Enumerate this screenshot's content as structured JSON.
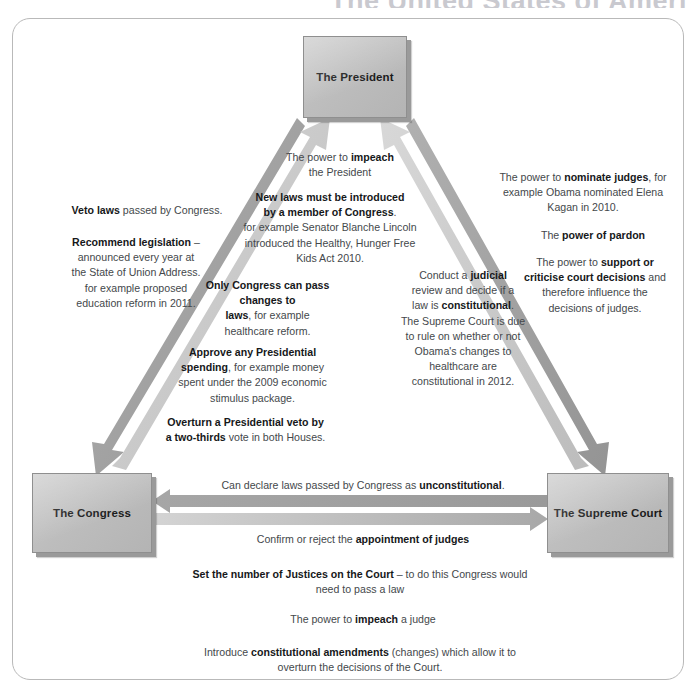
{
  "page": {
    "title_cropped": "The United States of Ameri"
  },
  "nodes": {
    "president": "The President",
    "congress": "The Congress",
    "supreme_court": "The Supreme Court"
  },
  "annotations": {
    "congress_to_president": [
      {
        "id": "impeach-president",
        "lines": [
          [
            {
              "t": "The power to ",
              "b": false
            },
            {
              "t": "impeach",
              "b": true
            }
          ],
          [
            {
              "t": "the President",
              "b": false
            }
          ]
        ]
      },
      {
        "id": "new-laws-introduced",
        "lines": [
          [
            {
              "t": "New laws must be introduced",
              "b": true
            }
          ],
          [
            {
              "t": "by a member of Congress",
              "b": true
            },
            {
              "t": ".",
              "b": false
            }
          ],
          [
            {
              "t": "for example Senator Blanche Lincoln",
              "b": false
            }
          ],
          [
            {
              "t": "introduced the Healthy, Hunger Free",
              "b": false
            }
          ],
          [
            {
              "t": "Kids Act 2010.",
              "b": false
            }
          ]
        ]
      },
      {
        "id": "only-congress-changes-laws",
        "lines": [
          [
            {
              "t": "Only Congress can pass",
              "b": true
            }
          ],
          [
            {
              "t": "changes to",
              "b": true
            }
          ],
          [
            {
              "t": "laws",
              "b": true
            },
            {
              "t": ", for example",
              "b": false
            }
          ],
          [
            {
              "t": "healthcare reform.",
              "b": false
            }
          ]
        ]
      },
      {
        "id": "approve-presidential-spending",
        "lines": [
          [
            {
              "t": "Approve any Presidential",
              "b": true
            }
          ],
          [
            {
              "t": "spending",
              "b": true
            },
            {
              "t": ", for example money",
              "b": false
            }
          ],
          [
            {
              "t": "spent under the 2009 economic",
              "b": false
            }
          ],
          [
            {
              "t": "stimulus package.",
              "b": false
            }
          ]
        ]
      },
      {
        "id": "overturn-presidential-veto",
        "lines": [
          [
            {
              "t": "Overturn a Presidential veto by",
              "b": true
            }
          ],
          [
            {
              "t": "a two-thirds",
              "b": true
            },
            {
              "t": " vote in both Houses.",
              "b": false
            }
          ]
        ]
      }
    ],
    "president_to_congress": [
      {
        "id": "veto-laws",
        "lines": [
          [
            {
              "t": "Veto laws",
              "b": true
            },
            {
              "t": " passed by Congress.",
              "b": false
            }
          ]
        ]
      },
      {
        "id": "recommend-legislation",
        "lines": [
          [
            {
              "t": "Recommend legislation",
              "b": true
            },
            {
              "t": " –",
              "b": false
            }
          ],
          [
            {
              "t": "announced every year at",
              "b": false
            }
          ],
          [
            {
              "t": "the State of Union Address.",
              "b": false
            }
          ],
          [
            {
              "t": "for example proposed",
              "b": false
            }
          ],
          [
            {
              "t": "education reform in 2011.",
              "b": false
            }
          ]
        ]
      }
    ],
    "president_to_court": [
      {
        "id": "nominate-judges",
        "lines": [
          [
            {
              "t": "The power to ",
              "b": false
            },
            {
              "t": "nominate judges",
              "b": true
            },
            {
              "t": ", for",
              "b": false
            }
          ],
          [
            {
              "t": "example Obama nominated Elena",
              "b": false
            }
          ],
          [
            {
              "t": "Kagan in 2010.",
              "b": false
            }
          ]
        ]
      },
      {
        "id": "power-of-pardon",
        "lines": [
          [
            {
              "t": "The ",
              "b": false
            },
            {
              "t": "power of pardon",
              "b": true
            }
          ]
        ]
      },
      {
        "id": "support-or-criticise",
        "lines": [
          [
            {
              "t": "The power to ",
              "b": false
            },
            {
              "t": "support or",
              "b": true
            }
          ],
          [
            {
              "t": "criticise court decisions",
              "b": true
            },
            {
              "t": " and",
              "b": false
            }
          ],
          [
            {
              "t": "therefore influence the",
              "b": false
            }
          ],
          [
            {
              "t": "decisions of judges.",
              "b": false
            }
          ]
        ]
      }
    ],
    "court_to_president": [
      {
        "id": "judicial-review",
        "lines": [
          [
            {
              "t": "Conduct a ",
              "b": false
            },
            {
              "t": "judicial",
              "b": true
            }
          ],
          [
            {
              "t": "review  and decide if a",
              "b": false
            }
          ],
          [
            {
              "t": "law is ",
              "b": false
            },
            {
              "t": "constitutional",
              "b": true
            },
            {
              "t": ".",
              "b": false
            }
          ],
          [
            {
              "t": "The Supreme Court is due",
              "b": false
            }
          ],
          [
            {
              "t": "to rule on  whether or not",
              "b": false
            }
          ],
          [
            {
              "t": "Obama's changes to",
              "b": false
            }
          ],
          [
            {
              "t": "healthcare are",
              "b": false
            }
          ],
          [
            {
              "t": "constitutional in 2012.",
              "b": false
            }
          ]
        ]
      }
    ],
    "court_to_congress": [
      {
        "id": "declare-unconstitutional",
        "lines": [
          [
            {
              "t": "Can declare laws passed by Congress as ",
              "b": false
            },
            {
              "t": "unconstitutional",
              "b": true
            },
            {
              "t": ".",
              "b": false
            }
          ]
        ]
      }
    ],
    "congress_to_court": [
      {
        "id": "confirm-or-reject-judges",
        "lines": [
          [
            {
              "t": "Confirm or reject the ",
              "b": false
            },
            {
              "t": "appointment of judges",
              "b": true
            }
          ]
        ]
      },
      {
        "id": "set-number-of-justices",
        "lines": [
          [
            {
              "t": "Set the number of Justices on the Court",
              "b": true
            },
            {
              "t": " – to do this Congress would",
              "b": false
            }
          ],
          [
            {
              "t": "need to pass a law",
              "b": false
            }
          ]
        ]
      },
      {
        "id": "impeach-a-judge",
        "lines": [
          [
            {
              "t": "The power to ",
              "b": false
            },
            {
              "t": "impeach",
              "b": true
            },
            {
              "t": " a judge",
              "b": false
            }
          ]
        ]
      },
      {
        "id": "constitutional-amendments",
        "lines": [
          [
            {
              "t": "Introduce ",
              "b": false
            },
            {
              "t": "constitutional amendments",
              "b": true
            },
            {
              "t": " (changes) which allow it to",
              "b": false
            }
          ],
          [
            {
              "t": "overturn the decisions of the Court.",
              "b": false
            }
          ]
        ]
      }
    ]
  },
  "colors": {
    "arrow_dark": "#9d9d9d",
    "arrow_light": "#c8c8c8",
    "box_fill": "#bdbdbd",
    "box_border": "#8f8f8f",
    "frame_border": "#b9b9b9",
    "title": "#c9c9cf",
    "text": "#44484b",
    "text_bold": "#16181a"
  }
}
